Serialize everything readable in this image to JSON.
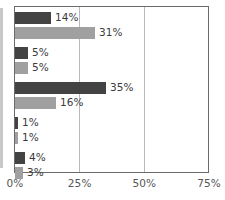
{
  "chart_data": {
    "type": "bar",
    "orientation": "horizontal",
    "title": "",
    "xlabel": "",
    "ylabel": "",
    "xlim": [
      0,
      75
    ],
    "grid": true,
    "gridlines": [
      0,
      25,
      50,
      75
    ],
    "legend": "none",
    "categories": [
      "",
      "",
      "",
      "",
      ""
    ],
    "tick_labels": [
      "0%",
      "25%",
      "50%",
      "75%"
    ],
    "series": [
      {
        "name": "series-1",
        "color": "#434343",
        "values": [
          14,
          5,
          35,
          1,
          4
        ],
        "data_labels": [
          "14%",
          "5%",
          "35%",
          "1%",
          "4%"
        ]
      },
      {
        "name": "series-2",
        "color": "#a0a0a0",
        "values": [
          31,
          5,
          16,
          1,
          3
        ],
        "data_labels": [
          "31%",
          "5%",
          "16%",
          "1%",
          "3%"
        ]
      }
    ]
  },
  "colors": {
    "series_dark": "#434343",
    "series_light": "#a0a0a0",
    "frame": "#6b6b6b",
    "gridline": "#b9b9b9",
    "label_text": "#3b3b3b",
    "tick_text": "#555555",
    "background": "#ffffff"
  }
}
